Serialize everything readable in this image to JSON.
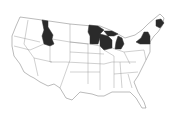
{
  "map": {
    "region": "Contiguous United States",
    "type": "choropleth",
    "highlight_color": "#2a2a2a",
    "base_color": "#ffffff",
    "highlighted_states": [
      "Idaho",
      "Minnesota",
      "Wisconsin",
      "Michigan",
      "New York",
      "Maine"
    ]
  }
}
